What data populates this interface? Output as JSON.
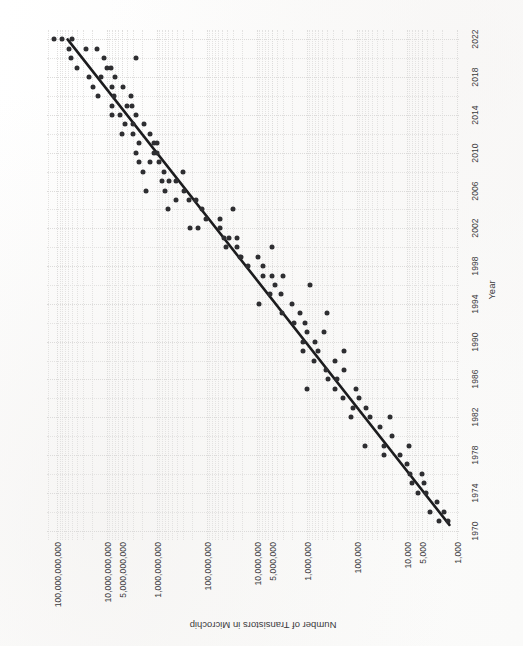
{
  "figure": {
    "background_color": "#fdfdfd",
    "orientation_note": "rotated-90",
    "dot_color": "#2e2e31",
    "trendline_color": "#1c1c1e",
    "grid_color": "#e3e2e1"
  },
  "chart_data": {
    "type": "scatter",
    "title": "",
    "xlabel": "Year",
    "ylabel": "Number of Transistors in Microchip",
    "x_ticks": [
      1970,
      1974,
      1978,
      1982,
      1986,
      1990,
      1994,
      1998,
      2002,
      2006,
      2010,
      2014,
      2018,
      2022
    ],
    "x_tick_labels": [
      "1970",
      "1974",
      "1978",
      "1982",
      "1986",
      "1990",
      "1994",
      "1998",
      "2002",
      "2006",
      "2010",
      "2014",
      "2018",
      "2022"
    ],
    "xlim": [
      1969,
      2023
    ],
    "y_scale": "log",
    "y_ticks": [
      1000,
      5000,
      10000,
      100000,
      1000000,
      5000000,
      10000000,
      100000000,
      1000000000,
      5000000000,
      10000000000,
      100000000000
    ],
    "y_tick_labels": [
      "1,000",
      "5,000",
      "10,000",
      "100,000",
      "1,000,000",
      "5,000,000",
      "10,000,000",
      "100,000,000",
      "1,000,000,000",
      "5,000,000,000",
      "10,000,000,000",
      "100,000,000,000"
    ],
    "ylim": [
      900,
      160000000000
    ],
    "grid": true,
    "legend": null,
    "trendline": {
      "label": "Moore's Law fit",
      "x0": 1970.6,
      "y0": 1400,
      "x1": 2022.0,
      "y1": 62000000000
    },
    "points": [
      {
        "x": 1971,
        "y": 2300
      },
      {
        "x": 1972,
        "y": 3500
      },
      {
        "x": 1974,
        "y": 4100
      },
      {
        "x": 1974,
        "y": 6000
      },
      {
        "x": 1975,
        "y": 8000
      },
      {
        "x": 1976,
        "y": 5000
      },
      {
        "x": 1976,
        "y": 8500
      },
      {
        "x": 1978,
        "y": 29000
      },
      {
        "x": 1979,
        "y": 9000
      },
      {
        "x": 1979,
        "y": 29000
      },
      {
        "x": 1979,
        "y": 68000
      },
      {
        "x": 1982,
        "y": 55000
      },
      {
        "x": 1982,
        "y": 134000
      },
      {
        "x": 1982,
        "y": 22000
      },
      {
        "x": 1983,
        "y": 120000
      },
      {
        "x": 1984,
        "y": 190000
      },
      {
        "x": 1985,
        "y": 275000
      },
      {
        "x": 1985,
        "y": 105000
      },
      {
        "x": 1986,
        "y": 250000
      },
      {
        "x": 1987,
        "y": 180000
      },
      {
        "x": 1988,
        "y": 275000
      },
      {
        "x": 1988,
        "y": 730000
      },
      {
        "x": 1989,
        "y": 1180000
      },
      {
        "x": 1989,
        "y": 600000
      },
      {
        "x": 1990,
        "y": 1200000
      },
      {
        "x": 1991,
        "y": 1000000
      },
      {
        "x": 1992,
        "y": 1100000
      },
      {
        "x": 1993,
        "y": 3100000
      },
      {
        "x": 1993,
        "y": 1400000
      },
      {
        "x": 1994,
        "y": 2000000
      },
      {
        "x": 1994,
        "y": 9300000
      },
      {
        "x": 1995,
        "y": 5500000
      },
      {
        "x": 1995,
        "y": 3300000
      },
      {
        "x": 1996,
        "y": 4300000
      },
      {
        "x": 1997,
        "y": 7500000
      },
      {
        "x": 1997,
        "y": 5000000
      },
      {
        "x": 1998,
        "y": 7500000
      },
      {
        "x": 1999,
        "y": 9500000
      },
      {
        "x": 1999,
        "y": 21300000
      },
      {
        "x": 1999,
        "y": 22000000
      },
      {
        "x": 2000,
        "y": 42000000
      },
      {
        "x": 2000,
        "y": 25000000
      },
      {
        "x": 2001,
        "y": 45000000
      },
      {
        "x": 2001,
        "y": 25000000
      },
      {
        "x": 2002,
        "y": 55000000
      },
      {
        "x": 2002,
        "y": 220000000
      },
      {
        "x": 2003,
        "y": 105000000
      },
      {
        "x": 2003,
        "y": 54000000
      },
      {
        "x": 2004,
        "y": 125000000
      },
      {
        "x": 2004,
        "y": 592000000
      },
      {
        "x": 2005,
        "y": 230000000
      },
      {
        "x": 2005,
        "y": 169000000
      },
      {
        "x": 2006,
        "y": 291000000
      },
      {
        "x": 2006,
        "y": 1700000000
      },
      {
        "x": 2007,
        "y": 582000000
      },
      {
        "x": 2007,
        "y": 789000000
      },
      {
        "x": 2008,
        "y": 731000000
      },
      {
        "x": 2008,
        "y": 1900000000
      },
      {
        "x": 2009,
        "y": 904000000
      },
      {
        "x": 2009,
        "y": 2300000000
      },
      {
        "x": 2010,
        "y": 1170000000
      },
      {
        "x": 2010,
        "y": 2600000000
      },
      {
        "x": 2011,
        "y": 1160000000
      },
      {
        "x": 2011,
        "y": 2270000000
      },
      {
        "x": 2012,
        "y": 1400000000
      },
      {
        "x": 2012,
        "y": 5000000000
      },
      {
        "x": 2013,
        "y": 1860000000
      },
      {
        "x": 2013,
        "y": 4310000000
      },
      {
        "x": 2014,
        "y": 2600000000
      },
      {
        "x": 2014,
        "y": 5560000000
      },
      {
        "x": 2015,
        "y": 3200000000
      },
      {
        "x": 2015,
        "y": 8000000000
      },
      {
        "x": 2016,
        "y": 3300000000
      },
      {
        "x": 2016,
        "y": 7200000000
      },
      {
        "x": 2017,
        "y": 4800000000
      },
      {
        "x": 2017,
        "y": 19200000000
      },
      {
        "x": 2018,
        "y": 6900000000
      },
      {
        "x": 2018,
        "y": 23600000000
      },
      {
        "x": 2019,
        "y": 8300000000
      },
      {
        "x": 2019,
        "y": 39540000000
      },
      {
        "x": 2020,
        "y": 11800000000
      },
      {
        "x": 2020,
        "y": 54000000000
      },
      {
        "x": 2021,
        "y": 16000000000
      },
      {
        "x": 2021,
        "y": 57000000000
      },
      {
        "x": 2022,
        "y": 114000000000
      },
      {
        "x": 2022,
        "y": 80000000000
      },
      {
        "x": 2020,
        "y": 2600000000
      },
      {
        "x": 1985,
        "y": 1000000
      },
      {
        "x": 1993,
        "y": 400000
      },
      {
        "x": 1996,
        "y": 880000
      },
      {
        "x": 2000,
        "y": 5000000
      },
      {
        "x": 2004,
        "y": 30000000
      },
      {
        "x": 2008,
        "y": 300000000
      },
      {
        "x": 1989,
        "y": 180000
      },
      {
        "x": 1991,
        "y": 450000
      },
      {
        "x": 1986,
        "y": 380000
      },
      {
        "x": 1984,
        "y": 90000
      },
      {
        "x": 1983,
        "y": 65000
      },
      {
        "x": 1981,
        "y": 35000
      },
      {
        "x": 1980,
        "y": 20000
      },
      {
        "x": 1978,
        "y": 14000
      },
      {
        "x": 1977,
        "y": 10000
      },
      {
        "x": 1975,
        "y": 4500
      },
      {
        "x": 1973,
        "y": 2500
      },
      {
        "x": 1971,
        "y": 1500
      },
      {
        "x": 1972,
        "y": 1800
      },
      {
        "x": 1998,
        "y": 15000000
      },
      {
        "x": 2002,
        "y": 152000000
      },
      {
        "x": 2006,
        "y": 681000000
      },
      {
        "x": 2011,
        "y": 1000000000
      },
      {
        "x": 2015,
        "y": 4000000000
      },
      {
        "x": 2019,
        "y": 10000000000
      },
      {
        "x": 2017,
        "y": 8000000000
      },
      {
        "x": 2013,
        "y": 3000000000
      },
      {
        "x": 2009,
        "y": 1400000000
      },
      {
        "x": 2005,
        "y": 410000000
      },
      {
        "x": 2001,
        "y": 37000000
      },
      {
        "x": 1997,
        "y": 3000000
      },
      {
        "x": 1992,
        "y": 1800000
      },
      {
        "x": 1990,
        "y": 700000
      },
      {
        "x": 1987,
        "y": 420000
      },
      {
        "x": 2021,
        "y": 26000000000
      },
      {
        "x": 2022,
        "y": 50000000000
      },
      {
        "x": 2018,
        "y": 13000000000
      },
      {
        "x": 2016,
        "y": 15300000000
      },
      {
        "x": 2014,
        "y": 8100000000
      },
      {
        "x": 2012,
        "y": 3100000000
      },
      {
        "x": 2010,
        "y": 1000000000
      },
      {
        "x": 2007,
        "y": 410000000
      }
    ]
  }
}
